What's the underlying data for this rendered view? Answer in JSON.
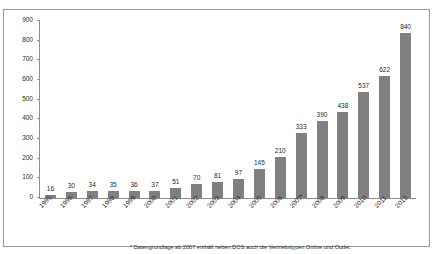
{
  "chart_data": {
    "type": "bar",
    "title": "",
    "xlabel": "",
    "ylabel": "",
    "ylim": [
      0,
      900
    ],
    "ytick_step": 100,
    "yticks": [
      900,
      800,
      700,
      600,
      500,
      400,
      300,
      200,
      100,
      0
    ],
    "grid": false,
    "legend": "none",
    "bar_color": "#808080",
    "axis_color": "#8d8d8d",
    "categories": [
      "1995",
      "1996",
      "1997",
      "1998",
      "1999",
      "2000",
      "2001",
      "2002",
      "2003",
      "2004",
      "2005",
      "2006",
      "2007*",
      "2008",
      "2009",
      "2010",
      "2011",
      "2012"
    ],
    "values": [
      16,
      30,
      34,
      35,
      36,
      37,
      51,
      70,
      81,
      97,
      145,
      210,
      333,
      390,
      438,
      537,
      622,
      840
    ],
    "annotations": [
      "* Datengrundlage ab 2007 enthält neben DOS auch die Vertriebstypen Online und Outlet."
    ]
  },
  "footnote": "* Datengrundlage ab 2007 enthält neben DOS auch die Vertriebstypen Online und Outlet."
}
